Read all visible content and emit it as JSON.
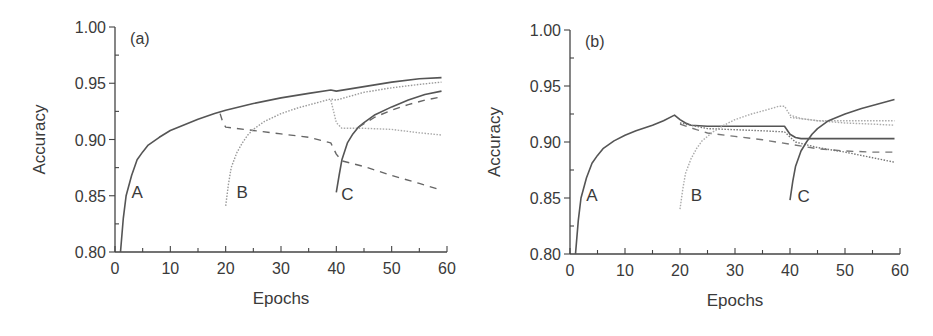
{
  "chart_data": [
    {
      "type": "line",
      "panel_label": "(a)",
      "xlabel": "Epochs",
      "ylabel": "Accuracy",
      "xlim": [
        0,
        60
      ],
      "ylim": [
        0.8,
        1.0
      ],
      "xticks": [
        "0",
        "10",
        "20",
        "30",
        "40",
        "50",
        "60"
      ],
      "yticks": [
        "0.80",
        "0.85",
        "0.90",
        "0.95",
        "1.00"
      ],
      "grid": false,
      "annotations": [
        {
          "text": "A",
          "x": 4,
          "y": 0.853
        },
        {
          "text": "B",
          "x": 23,
          "y": 0.853
        },
        {
          "text": "C",
          "x": 42,
          "y": 0.852
        }
      ],
      "series": [
        {
          "name": "A-main",
          "style": "solid",
          "color": "#555555",
          "x": [
            1,
            1.5,
            2,
            3,
            4,
            5,
            6,
            8,
            10,
            12,
            15,
            18,
            20,
            25,
            30,
            35,
            39,
            40,
            45,
            50,
            55,
            59
          ],
          "values": [
            0.8,
            0.83,
            0.85,
            0.868,
            0.882,
            0.889,
            0.895,
            0.902,
            0.908,
            0.912,
            0.918,
            0.923,
            0.926,
            0.932,
            0.937,
            0.941,
            0.944,
            0.943,
            0.947,
            0.951,
            0.954,
            0.955
          ]
        },
        {
          "name": "A-dashed-after-20",
          "style": "dashed",
          "color": "#666666",
          "x": [
            19,
            19.5,
            20,
            25,
            30,
            35,
            39,
            40,
            41,
            45,
            50,
            55,
            59
          ],
          "values": [
            0.923,
            0.915,
            0.911,
            0.908,
            0.905,
            0.902,
            0.897,
            0.887,
            0.881,
            0.876,
            0.868,
            0.861,
            0.855
          ]
        },
        {
          "name": "B",
          "style": "dotted",
          "color": "#999999",
          "x": [
            20,
            20.5,
            21,
            22,
            23,
            24,
            25,
            27,
            30,
            33,
            36,
            39,
            40,
            45,
            50,
            55,
            59
          ],
          "values": [
            0.841,
            0.86,
            0.875,
            0.888,
            0.897,
            0.904,
            0.909,
            0.916,
            0.923,
            0.928,
            0.932,
            0.936,
            0.935,
            0.942,
            0.946,
            0.949,
            0.951
          ]
        },
        {
          "name": "B-dotted-after-40",
          "style": "dotted",
          "color": "#aaaaaa",
          "x": [
            39,
            39.5,
            40,
            41,
            45,
            50,
            55,
            59
          ],
          "values": [
            0.935,
            0.925,
            0.915,
            0.91,
            0.91,
            0.909,
            0.906,
            0.904
          ]
        },
        {
          "name": "C",
          "style": "solid",
          "color": "#555555",
          "x": [
            40,
            40.5,
            41,
            42,
            43,
            44,
            45,
            47,
            50,
            53,
            56,
            59
          ],
          "values": [
            0.853,
            0.868,
            0.882,
            0.897,
            0.905,
            0.911,
            0.915,
            0.922,
            0.929,
            0.935,
            0.94,
            0.943
          ]
        },
        {
          "name": "C-dashed",
          "style": "dashed",
          "color": "#666666",
          "x": [
            44,
            47,
            50,
            53,
            56,
            59
          ],
          "values": [
            0.911,
            0.92,
            0.926,
            0.931,
            0.935,
            0.938
          ]
        }
      ]
    },
    {
      "type": "line",
      "panel_label": "(b)",
      "xlabel": "Epochs",
      "ylabel": "Accuracy",
      "xlim": [
        0,
        60
      ],
      "ylim": [
        0.8,
        1.0
      ],
      "xticks": [
        "0",
        "10",
        "20",
        "30",
        "40",
        "50",
        "60"
      ],
      "yticks": [
        "0.80",
        "0.85",
        "0.90",
        "0.95",
        "1.00"
      ],
      "grid": false,
      "annotations": [
        {
          "text": "A",
          "x": 4,
          "y": 0.853
        },
        {
          "text": "B",
          "x": 23,
          "y": 0.853
        },
        {
          "text": "C",
          "x": 42.5,
          "y": 0.852
        }
      ],
      "series": [
        {
          "name": "A-main",
          "style": "solid",
          "color": "#555555",
          "x": [
            1,
            1.5,
            2,
            3,
            4,
            5,
            6,
            8,
            10,
            12,
            15,
            17,
            19,
            20,
            21,
            22,
            25,
            30,
            35,
            39,
            40,
            41,
            42,
            45,
            50,
            55,
            59
          ],
          "values": [
            0.8,
            0.83,
            0.85,
            0.868,
            0.881,
            0.888,
            0.894,
            0.901,
            0.906,
            0.91,
            0.915,
            0.919,
            0.924,
            0.92,
            0.917,
            0.915,
            0.914,
            0.914,
            0.914,
            0.914,
            0.907,
            0.904,
            0.903,
            0.903,
            0.903,
            0.903,
            0.903
          ]
        },
        {
          "name": "A-dotted-after-20",
          "style": "dotted",
          "color": "#777777",
          "x": [
            20,
            25,
            30,
            35,
            39,
            41,
            45,
            50,
            55,
            59
          ],
          "values": [
            0.917,
            0.912,
            0.911,
            0.91,
            0.909,
            0.9,
            0.895,
            0.891,
            0.886,
            0.882
          ]
        },
        {
          "name": "A-dashed-after-20",
          "style": "dashed",
          "color": "#777777",
          "x": [
            20,
            23,
            25,
            30,
            35,
            40,
            45,
            50,
            55,
            59
          ],
          "values": [
            0.916,
            0.911,
            0.908,
            0.905,
            0.902,
            0.898,
            0.894,
            0.892,
            0.891,
            0.891
          ]
        },
        {
          "name": "B",
          "style": "dotted",
          "color": "#aaaaaa",
          "x": [
            20,
            20.5,
            21,
            22,
            23,
            24,
            26,
            28,
            30,
            33,
            36,
            38,
            39,
            40,
            42,
            45,
            50,
            55,
            59
          ],
          "values": [
            0.84,
            0.858,
            0.872,
            0.885,
            0.894,
            0.901,
            0.909,
            0.915,
            0.92,
            0.925,
            0.929,
            0.932,
            0.932,
            0.924,
            0.921,
            0.919,
            0.919,
            0.919,
            0.919
          ]
        },
        {
          "name": "B-dotted-2",
          "style": "dotted",
          "color": "#aaaaaa",
          "x": [
            40,
            45,
            50,
            55,
            59
          ],
          "values": [
            0.922,
            0.919,
            0.917,
            0.916,
            0.915
          ]
        },
        {
          "name": "C",
          "style": "solid",
          "color": "#555555",
          "x": [
            40,
            40.5,
            41,
            42,
            43,
            44,
            45,
            47,
            50,
            53,
            56,
            59
          ],
          "values": [
            0.848,
            0.865,
            0.878,
            0.892,
            0.9,
            0.907,
            0.912,
            0.919,
            0.925,
            0.93,
            0.934,
            0.938
          ]
        }
      ]
    }
  ]
}
